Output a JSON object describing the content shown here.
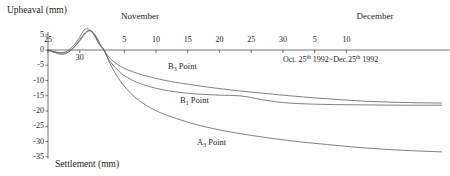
{
  "chart_data": {
    "type": "line",
    "title": "",
    "ylabel_top": "Upheaval (mm)",
    "ylabel_bottom": "Settlement (mm)",
    "xlabel": "",
    "annotation": {
      "prefix": "Oct. 25",
      "sup1": "th",
      "middle": " 1992~Dec.25",
      "sup2": "th",
      "suffix": " 1992"
    },
    "month_labels": [
      {
        "text": "November",
        "x": 140
      },
      {
        "text": "December",
        "x": 375
      }
    ],
    "ylim": [
      -35,
      5
    ],
    "yticks": [
      5,
      0,
      -5,
      -10,
      -15,
      -20,
      -25,
      -30,
      -35
    ],
    "ytick_labels": [
      "5",
      "0",
      "-5",
      "-10",
      "-15",
      "-20",
      "-25",
      "-30",
      "-35"
    ],
    "xlim": [
      0,
      62
    ],
    "xticks": [
      0,
      5,
      12,
      17,
      22,
      27,
      32,
      37,
      42,
      47
    ],
    "xtick_labels": [
      "25",
      "30",
      "5",
      "10",
      "15",
      "20",
      "25",
      "30",
      "5",
      "10"
    ],
    "grid": false,
    "legend_position": "inline-annotations",
    "series": [
      {
        "name": "B3 Point",
        "label_base": "B",
        "label_sub": "3",
        "label_suffix": " Point",
        "label_x": 168,
        "label_y": 62,
        "points": [
          [
            0,
            0.0
          ],
          [
            1,
            -0.6
          ],
          [
            2,
            -1.0
          ],
          [
            3,
            -0.8
          ],
          [
            4,
            0.8
          ],
          [
            5,
            3.4
          ],
          [
            5.8,
            5.6
          ],
          [
            6.4,
            6.4
          ],
          [
            7,
            6.0
          ],
          [
            7.6,
            4.4
          ],
          [
            8.2,
            2.0
          ],
          [
            8.8,
            0.0
          ],
          [
            9.6,
            -2.4
          ],
          [
            10.6,
            -4.2
          ],
          [
            12,
            -6.0
          ],
          [
            14,
            -7.6
          ],
          [
            16,
            -8.8
          ],
          [
            19,
            -10.2
          ],
          [
            22,
            -11.2
          ],
          [
            26,
            -12.4
          ],
          [
            30,
            -13.4
          ],
          [
            34,
            -14.2
          ],
          [
            38,
            -15.0
          ],
          [
            42,
            -15.7
          ],
          [
            46,
            -16.3
          ],
          [
            50,
            -16.8
          ],
          [
            54,
            -17.1
          ],
          [
            58,
            -17.3
          ],
          [
            62,
            -17.4
          ]
        ]
      },
      {
        "name": "B1 Point",
        "label_base": "B",
        "label_sub": "1",
        "label_suffix": " Point",
        "label_x": 180,
        "label_y": 96,
        "points": [
          [
            0,
            0.0
          ],
          [
            1,
            -0.8
          ],
          [
            2,
            -1.4
          ],
          [
            3,
            -1.0
          ],
          [
            4,
            0.6
          ],
          [
            5,
            3.0
          ],
          [
            5.8,
            5.2
          ],
          [
            6.4,
            6.2
          ],
          [
            7,
            5.8
          ],
          [
            7.6,
            4.0
          ],
          [
            8.2,
            1.6
          ],
          [
            8.8,
            0.0
          ],
          [
            9.6,
            -3.2
          ],
          [
            10.6,
            -5.8
          ],
          [
            12,
            -8.4
          ],
          [
            14,
            -10.6
          ],
          [
            16,
            -12.0
          ],
          [
            18,
            -13.0
          ],
          [
            20,
            -13.7
          ],
          [
            22,
            -14.2
          ],
          [
            24,
            -14.5
          ],
          [
            27,
            -14.8
          ],
          [
            30,
            -15.0
          ],
          [
            32,
            -15.6
          ],
          [
            34,
            -16.4
          ],
          [
            36,
            -17.0
          ],
          [
            38,
            -17.4
          ],
          [
            41,
            -17.7
          ],
          [
            45,
            -17.9
          ],
          [
            50,
            -18.0
          ],
          [
            56,
            -18.1
          ],
          [
            62,
            -18.1
          ]
        ]
      },
      {
        "name": "A3 Point",
        "label_base": "A",
        "label_sub": "3",
        "label_suffix": " Point",
        "label_x": 197,
        "label_y": 138,
        "points": [
          [
            0,
            0.0
          ],
          [
            1,
            -0.5
          ],
          [
            2,
            -0.9
          ],
          [
            3,
            -0.4
          ],
          [
            4,
            1.4
          ],
          [
            5,
            4.2
          ],
          [
            5.6,
            6.4
          ],
          [
            6.2,
            7.0
          ],
          [
            6.8,
            6.2
          ],
          [
            7.4,
            4.4
          ],
          [
            8.0,
            2.0
          ],
          [
            8.8,
            0.0
          ],
          [
            9.8,
            -4.6
          ],
          [
            11,
            -9.0
          ],
          [
            12.5,
            -13.0
          ],
          [
            14,
            -16.0
          ],
          [
            16,
            -18.8
          ],
          [
            18,
            -20.8
          ],
          [
            21,
            -23.0
          ],
          [
            24,
            -24.8
          ],
          [
            28,
            -26.6
          ],
          [
            32,
            -28.0
          ],
          [
            36,
            -29.2
          ],
          [
            40,
            -30.2
          ],
          [
            44,
            -31.0
          ],
          [
            48,
            -31.8
          ],
          [
            52,
            -32.4
          ],
          [
            56,
            -32.9
          ],
          [
            62,
            -33.4
          ]
        ]
      }
    ]
  },
  "axes": {
    "x_origin_px": 48,
    "y_zero_px": 50,
    "px_per_unit_x": 6.35,
    "px_per_unit_y": 3.05
  }
}
